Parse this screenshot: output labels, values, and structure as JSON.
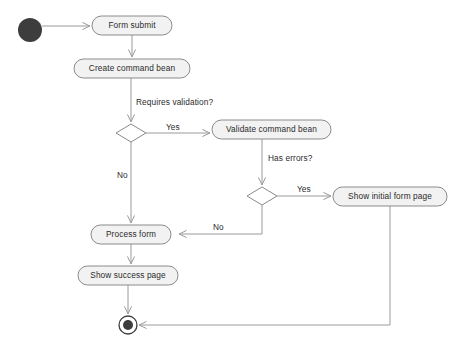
{
  "diagram": {
    "type": "uml-activity-diagram",
    "canvas": {
      "width": 459,
      "height": 348
    },
    "colors": {
      "background": "#ffffff",
      "node_fill": "#f2f2f2",
      "node_stroke": "#8a8a8a",
      "decision_fill": "#ffffff",
      "line": "#9a9a9a",
      "text": "#2b2b2b",
      "terminal": "#3d3d3d"
    },
    "nodes": [
      {
        "id": "start",
        "kind": "initial-node",
        "label": "",
        "cx": 30,
        "cy": 30,
        "r": 12
      },
      {
        "id": "form-submit",
        "kind": "action",
        "label": "Form submit",
        "x": 92,
        "y": 16,
        "w": 80,
        "h": 19
      },
      {
        "id": "create-command-bean",
        "kind": "action",
        "label": "Create command bean",
        "x": 74,
        "y": 59,
        "w": 116,
        "h": 19
      },
      {
        "id": "requires-validation",
        "kind": "decision",
        "label": "",
        "cx": 131,
        "cy": 133,
        "rx": 15,
        "ry": 9
      },
      {
        "id": "validate-command-bean",
        "kind": "action",
        "label": "Validate command bean",
        "x": 212,
        "y": 120,
        "w": 119,
        "h": 19
      },
      {
        "id": "has-errors",
        "kind": "decision",
        "label": "",
        "cx": 262,
        "cy": 196,
        "rx": 15,
        "ry": 9
      },
      {
        "id": "show-initial-form-page",
        "kind": "action",
        "label": "Show initial form page",
        "x": 333,
        "y": 187,
        "w": 114,
        "h": 19
      },
      {
        "id": "process-form",
        "kind": "action",
        "label": "Process form",
        "x": 91,
        "y": 225,
        "w": 80,
        "h": 19
      },
      {
        "id": "show-success-page",
        "kind": "action",
        "label": "Show success page",
        "x": 78,
        "y": 266,
        "w": 100,
        "h": 19
      },
      {
        "id": "end",
        "kind": "final-node",
        "label": "",
        "cx": 128,
        "cy": 325,
        "r_outer": 9,
        "r_inner": 5
      }
    ],
    "edge_labels": {
      "requires_validation": "Requires validation?",
      "has_errors": "Has errors?",
      "yes_validate": "Yes",
      "no_process": "No",
      "yes_initial_form": "Yes",
      "no_back_to_process": "No"
    },
    "edges": [
      {
        "from": "start",
        "to": "form-submit",
        "label": ""
      },
      {
        "from": "form-submit",
        "to": "create-command-bean",
        "label": ""
      },
      {
        "from": "create-command-bean",
        "to": "requires-validation",
        "label": "Requires validation?"
      },
      {
        "from": "requires-validation",
        "to": "validate-command-bean",
        "label": "Yes"
      },
      {
        "from": "requires-validation",
        "to": "process-form",
        "label": "No"
      },
      {
        "from": "validate-command-bean",
        "to": "has-errors",
        "label": "Has errors?"
      },
      {
        "from": "has-errors",
        "to": "show-initial-form-page",
        "label": "Yes"
      },
      {
        "from": "has-errors",
        "to": "process-form",
        "label": "No"
      },
      {
        "from": "process-form",
        "to": "show-success-page",
        "label": ""
      },
      {
        "from": "show-success-page",
        "to": "end",
        "label": ""
      },
      {
        "from": "show-initial-form-page",
        "to": "end",
        "label": ""
      }
    ]
  }
}
